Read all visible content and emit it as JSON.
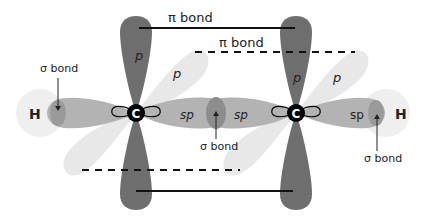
{
  "diagram": {
    "atoms": [
      {
        "symbol": "H",
        "position": "left"
      },
      {
        "symbol": "C",
        "position": "center-left"
      },
      {
        "symbol": "C",
        "position": "center-right"
      },
      {
        "symbol": "H",
        "position": "right"
      }
    ],
    "labels": {
      "pi_bond_top": "π bond",
      "pi_bond_dashed": "π bond",
      "sigma_left": "σ bond",
      "sigma_center": "σ bond",
      "sigma_right": "σ bond",
      "p_left_vertical": "p",
      "p_left_diagonal": "p",
      "p_right_vertical": "p",
      "p_right_diagonal": "p",
      "sp_left": "sp",
      "sp_center_left": "sp",
      "sp_center_right": "sp",
      "sp_right": "sp",
      "h_left": "H",
      "h_right": "H",
      "c_left": "C",
      "c_right": "C"
    },
    "colors": {
      "p_vertical": "#6b6b6b",
      "sp_lobe": "#b0b0b0",
      "p_diagonal": "#e6e6e6",
      "h_orbital": "#eeeeee",
      "overlap": "#8a8a8a",
      "carbon": "#000000"
    }
  }
}
